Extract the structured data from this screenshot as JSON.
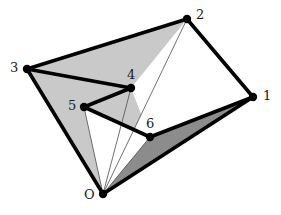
{
  "figure": {
    "type": "geometric-diagram",
    "canvas": {
      "width": 281,
      "height": 215,
      "background": "#ffffff"
    },
    "colors": {
      "light_fill": "#c9c9c9",
      "dark_fill": "#8c8c8c",
      "white_fill": "#ffffff",
      "stroke": "#000000",
      "thin_stroke": "#4d4d4d",
      "label_color": "#1a1a1a"
    },
    "strokes": {
      "outline_width": 3.6,
      "thin_width": 0.8,
      "vertex_radius": 4.2
    },
    "vertices": [
      {
        "id": "O",
        "label": "O",
        "x": 103,
        "y": 194,
        "label_x": 84,
        "label_y": 188
      },
      {
        "id": "1",
        "label": "1",
        "x": 253,
        "y": 97,
        "label_x": 263,
        "label_y": 89
      },
      {
        "id": "2",
        "label": "2",
        "x": 187,
        "y": 19,
        "label_x": 196,
        "label_y": 8
      },
      {
        "id": "3",
        "label": "3",
        "x": 27,
        "y": 69,
        "label_x": 10,
        "label_y": 61
      },
      {
        "id": "4",
        "label": "4",
        "x": 131,
        "y": 88,
        "label_x": 127,
        "label_y": 68
      },
      {
        "id": "5",
        "label": "5",
        "x": 84,
        "y": 107,
        "label_x": 68,
        "label_y": 99
      },
      {
        "id": "6",
        "label": "6",
        "x": 150,
        "y": 137,
        "label_x": 146,
        "label_y": 117
      }
    ],
    "polygon_boundary": [
      "O",
      "3",
      "4",
      "5",
      "6",
      "1",
      "2",
      "3"
    ],
    "outline_edges": [
      {
        "from": "3",
        "to": "2"
      },
      {
        "from": "2",
        "to": "1"
      },
      {
        "from": "1",
        "to": "6"
      },
      {
        "from": "6",
        "to": "5"
      },
      {
        "from": "5",
        "to": "4"
      },
      {
        "from": "4",
        "to": "3"
      },
      {
        "from": "3",
        "to": "O"
      },
      {
        "from": "O",
        "to": "1"
      }
    ],
    "fan_diagonals": [
      {
        "from": "O",
        "to": "2"
      },
      {
        "from": "O",
        "to": "3"
      },
      {
        "from": "O",
        "to": "4"
      },
      {
        "from": "O",
        "to": "5"
      },
      {
        "from": "O",
        "to": "6"
      }
    ],
    "faces": [
      {
        "name": "triangle-O-3-2",
        "vertices": [
          "O",
          "3",
          "2"
        ],
        "fill": "#c9c9c9"
      },
      {
        "name": "triangle-O-2-4",
        "vertices": [
          "O",
          "2",
          "4"
        ],
        "fill": "#c9c9c9"
      },
      {
        "name": "triangle-O-4-5",
        "vertices": [
          "O",
          "4",
          "5"
        ],
        "fill": "#c9c9c9"
      },
      {
        "name": "triangle-O-5-6",
        "vertices": [
          "O",
          "5",
          "6"
        ],
        "fill": "#ffffff"
      },
      {
        "name": "triangle-O-6-1",
        "vertices": [
          "O",
          "6",
          "1"
        ],
        "fill": "#8c8c8c"
      },
      {
        "name": "region-2-1-6-white",
        "vertices": [
          "2",
          "1",
          "6",
          "4"
        ],
        "fill": "#ffffff"
      }
    ]
  }
}
